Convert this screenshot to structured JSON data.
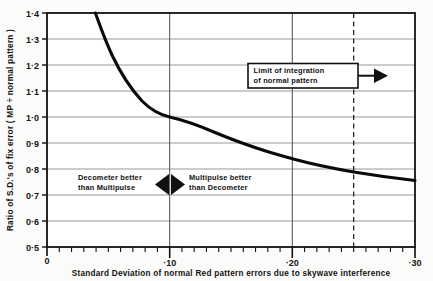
{
  "chart_data": {
    "type": "line",
    "title": "",
    "xlabel": "Standard Deviation of normal Red pattern errors due to skywave interference",
    "ylabel": "Ratio of S.D.'s of fix error ( MP ÷ normal pattern )",
    "xlim": [
      0.0,
      0.3
    ],
    "ylim": [
      0.5,
      1.4
    ],
    "grid": true,
    "legend": "none",
    "x_ticks": [
      0.0,
      0.1,
      0.2,
      0.3
    ],
    "x_tick_labels": [
      "0",
      "·10",
      "·20",
      "·30"
    ],
    "x_minor_tick_step": 0.01,
    "y_ticks": [
      0.5,
      0.6,
      0.7,
      0.8,
      0.9,
      1.0,
      1.1,
      1.2,
      1.3,
      1.4
    ],
    "y_tick_labels": [
      "0·5",
      "0·6",
      "0·7",
      "0·8",
      "0·9",
      "1·0",
      "1·1",
      "1·2",
      "1·3",
      "1·4"
    ],
    "series": [
      {
        "name": "ratio-curve",
        "x": [
          0.0395,
          0.042,
          0.045,
          0.048,
          0.052,
          0.056,
          0.06,
          0.065,
          0.07,
          0.075,
          0.08,
          0.085,
          0.09,
          0.095,
          0.1,
          0.11,
          0.12,
          0.13,
          0.14,
          0.15,
          0.16,
          0.17,
          0.18,
          0.19,
          0.2,
          0.21,
          0.22,
          0.23,
          0.24,
          0.25,
          0.26,
          0.27,
          0.28,
          0.29,
          0.3
        ],
        "y": [
          1.4,
          1.372,
          1.34,
          1.31,
          1.274,
          1.241,
          1.212,
          1.18,
          1.152,
          1.126,
          1.102,
          1.08,
          1.058,
          1.037,
          1.0,
          0.978,
          0.956,
          0.936,
          0.92,
          0.905,
          0.891,
          0.879,
          0.868,
          0.861,
          0.853,
          0.84,
          0.83,
          0.82,
          0.811,
          0.802,
          0.795,
          0.789,
          0.784,
          0.779,
          0.775
        ]
      }
    ],
    "reference_lines": [
      {
        "name": "limit-of-integration",
        "orientation": "vertical",
        "value": 0.25,
        "style": "dashed"
      },
      {
        "name": "unity-crossing-vertical",
        "orientation": "vertical",
        "value": 0.1,
        "style": "solid"
      }
    ],
    "annotations": [
      {
        "name": "limit-of-integration-box",
        "line1": "Limit of integration",
        "line2": "of  normal  pattern",
        "arrow": "right"
      },
      {
        "name": "decometer-better-label",
        "line1": "Decometer  better",
        "line2": "than Multipulse"
      },
      {
        "name": "multipulse-better-label",
        "line1": "Multipulse  better",
        "line2": "than  Decometer"
      }
    ],
    "colors": {
      "curve": "#0a0a0a",
      "axis": "#111111",
      "grid": "#8d8d8d",
      "background": "#fbfbfa",
      "text": "#111111"
    }
  }
}
